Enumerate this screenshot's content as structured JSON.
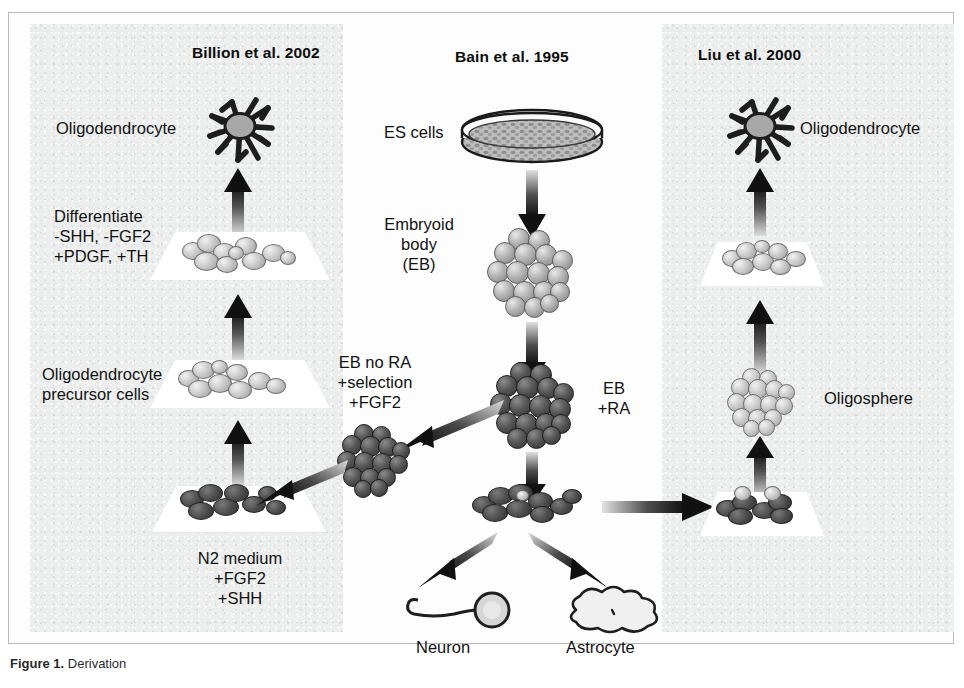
{
  "figure": {
    "caption_prefix": "Figure 1.",
    "caption_text": " Derivation"
  },
  "panels": {
    "left": {
      "study_title": "Billion et al. 2002",
      "labels": {
        "oligodendrocyte": "Oligodendrocyte",
        "differentiate": "Differentiate\n-SHH, -FGF2\n+PDGF, +TH",
        "precursor": "Oligodendrocyte\nprecursor cells",
        "n2_medium": "N2 medium\n+FGF2\n+SHH"
      }
    },
    "center": {
      "study_title": "Bain et al. 1995",
      "labels": {
        "es_cells": "ES cells",
        "embryoid_body": "Embryoid\nbody\n(EB)",
        "eb_no_ra": "EB no RA\n+selection\n+FGF2",
        "eb_ra": "EB\n+RA",
        "neuron": "Neuron",
        "astrocyte": "Astrocyte"
      }
    },
    "right": {
      "study_title": "Liu et al. 2000",
      "labels": {
        "oligodendrocyte": "Oligodendrocyte",
        "oligosphere": "Oligosphere"
      }
    }
  },
  "icons": {
    "oligodendrocyte": "oligodendrocyte-cell-icon",
    "petri_dish": "petri-dish-icon",
    "embryoid_body": "embryoid-body-icon",
    "oligosphere": "oligosphere-icon",
    "neuron": "neuron-icon",
    "astrocyte": "astrocyte-icon",
    "culture_plate": "culture-plate-icon",
    "arrow_up": "arrow-up-icon",
    "arrow_down": "arrow-down-icon",
    "arrow_diagonal": "arrow-diagonal-icon",
    "arrow_right": "arrow-right-icon"
  },
  "colors": {
    "panel_background": "#eceded",
    "page_background": "#ffffff",
    "cell_dark": "#3c3c3c",
    "cell_light": "#c9c9c9",
    "text": "#111111",
    "arrow": "#1a1a1a"
  }
}
